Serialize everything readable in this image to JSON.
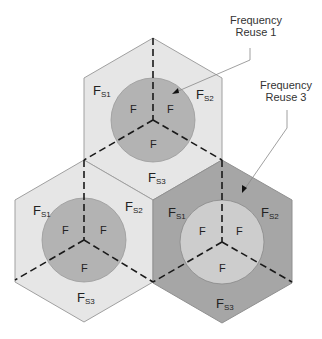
{
  "diagram": {
    "type": "cellular-frequency-reuse",
    "colors": {
      "light_cell": "#e6e6e6",
      "dark_cell": "#a6a6a6",
      "inner_circle_on_light": "#b3b3b3",
      "inner_circle_on_dark": "#d0d0d0",
      "dashed_line": "#1a1a1a",
      "cell_edge": "#9a9a9a"
    },
    "callouts": [
      {
        "id": "reuse1",
        "line1": "Frequency",
        "line2": "Reuse 1"
      },
      {
        "id": "reuse3",
        "line1": "Frequency",
        "line2": "Reuse 3"
      }
    ],
    "cells": [
      {
        "id": "top",
        "shade": "light",
        "outer": {
          "s1": "F",
          "s1_sub": "S1",
          "s2": "F",
          "s2_sub": "S2",
          "s3": "F",
          "s3_sub": "S3"
        },
        "inner": [
          "F",
          "F",
          "F"
        ]
      },
      {
        "id": "bottom-left",
        "shade": "light",
        "outer": {
          "s1": "F",
          "s1_sub": "S1",
          "s2": "F",
          "s2_sub": "S2",
          "s3": "F",
          "s3_sub": "S3"
        },
        "inner": [
          "F",
          "F",
          "F"
        ]
      },
      {
        "id": "bottom-right",
        "shade": "dark",
        "outer": {
          "s1": "F",
          "s1_sub": "S1",
          "s2": "F",
          "s2_sub": "S2",
          "s3": "F",
          "s3_sub": "S3"
        },
        "inner": [
          "F",
          "F",
          "F"
        ]
      }
    ]
  }
}
